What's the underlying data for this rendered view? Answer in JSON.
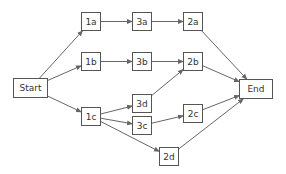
{
  "diagram": {
    "type": "network-diagram",
    "line_color": "#666666",
    "nodes": [
      {
        "id": "start",
        "label": "Start",
        "x": 13,
        "y": 78,
        "w": 35,
        "h": 20
      },
      {
        "id": "1a",
        "label": "1a",
        "x": 81,
        "y": 12,
        "w": 20,
        "h": 19
      },
      {
        "id": "1b",
        "label": "1b",
        "x": 81,
        "y": 52,
        "w": 20,
        "h": 19
      },
      {
        "id": "1c",
        "label": "1c",
        "x": 81,
        "y": 107,
        "w": 20,
        "h": 19
      },
      {
        "id": "3a",
        "label": "3a",
        "x": 132,
        "y": 12,
        "w": 20,
        "h": 19
      },
      {
        "id": "3b",
        "label": "3b",
        "x": 132,
        "y": 52,
        "w": 20,
        "h": 19
      },
      {
        "id": "3d",
        "label": "3d",
        "x": 132,
        "y": 94,
        "w": 20,
        "h": 19
      },
      {
        "id": "3c",
        "label": "3c",
        "x": 132,
        "y": 116,
        "w": 20,
        "h": 19
      },
      {
        "id": "2a",
        "label": "2a",
        "x": 183,
        "y": 12,
        "w": 20,
        "h": 19
      },
      {
        "id": "2b",
        "label": "2b",
        "x": 183,
        "y": 52,
        "w": 20,
        "h": 19
      },
      {
        "id": "2c",
        "label": "2c",
        "x": 183,
        "y": 104,
        "w": 20,
        "h": 19
      },
      {
        "id": "2d",
        "label": "2d",
        "x": 159,
        "y": 147,
        "w": 20,
        "h": 19
      },
      {
        "id": "end",
        "label": "End",
        "x": 239,
        "y": 79,
        "w": 34,
        "h": 20
      }
    ],
    "edges": [
      {
        "from": "start",
        "to": "1a"
      },
      {
        "from": "start",
        "to": "1b"
      },
      {
        "from": "start",
        "to": "1c"
      },
      {
        "from": "1a",
        "to": "3a"
      },
      {
        "from": "3a",
        "to": "2a"
      },
      {
        "from": "1b",
        "to": "3b"
      },
      {
        "from": "3b",
        "to": "2b"
      },
      {
        "from": "1c",
        "to": "3d"
      },
      {
        "from": "1c",
        "to": "3c"
      },
      {
        "from": "1c",
        "to": "2d"
      },
      {
        "from": "3d",
        "to": "2b"
      },
      {
        "from": "3c",
        "to": "2c"
      },
      {
        "from": "2a",
        "to": "end"
      },
      {
        "from": "2b",
        "to": "end"
      },
      {
        "from": "2c",
        "to": "end"
      },
      {
        "from": "2d",
        "to": "end"
      }
    ]
  }
}
